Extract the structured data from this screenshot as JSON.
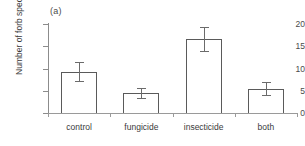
{
  "figure": {
    "panel_label": "(a)",
    "background": "#ffffff"
  },
  "chart_data": {
    "type": "bar",
    "title": "",
    "panel_label": "(a)",
    "categories": [
      "control",
      "fungicide",
      "insecticide",
      "both"
    ],
    "values": [
      9.3,
      4.5,
      16.7,
      5.5
    ],
    "errors": [
      2.2,
      1.1,
      2.7,
      1.4
    ],
    "error_type": "standard error (symmetric)",
    "xlabel": "",
    "ylabel": "Number of forb species",
    "ylim": [
      0,
      20
    ],
    "yticks": [
      0,
      5,
      10,
      15,
      20
    ],
    "ytick_labels": [
      "0",
      "5",
      "10",
      "15",
      "20"
    ],
    "grid": false,
    "legend": false,
    "bar_facecolor": "#ffffff",
    "bar_edgecolor": "#5a5a5a",
    "error_color": "#6b6b6b",
    "axis_color": "#8c8c8c"
  }
}
